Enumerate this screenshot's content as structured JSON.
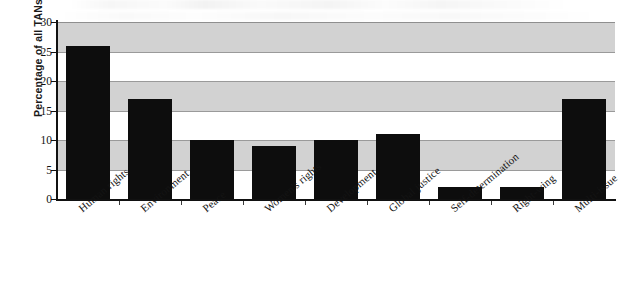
{
  "chart_data": {
    "type": "bar",
    "title": "",
    "subtitle": "",
    "xlabel": "",
    "ylabel": "Percentage of all TANs",
    "categories": [
      "Human rights",
      "Environment",
      "Peace",
      "Women's rights",
      "Development",
      "Global justice",
      "Self-determination",
      "Right-wing",
      "Multi-issue"
    ],
    "values": [
      26,
      17,
      10,
      9,
      10,
      11,
      2,
      2,
      17
    ],
    "ylim": [
      0,
      30
    ],
    "yticks": [
      0,
      5,
      10,
      15,
      20,
      25,
      30
    ],
    "ytick_labels": [
      "0",
      "5",
      "10",
      "15",
      "20",
      "25",
      "30"
    ],
    "grid": true,
    "legend": false,
    "legend_position": "none",
    "bar_color": "#0d0d0d",
    "band_color": "#d2d2d2",
    "gridline_color": "#9a9a9a",
    "axis_color": "#111111",
    "background_color": "#ffffff",
    "banding": "alternating horizontal bands every 5 units starting gray from 25-30",
    "label_rotation_deg": -40,
    "annotations": []
  }
}
